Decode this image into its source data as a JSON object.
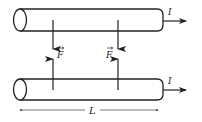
{
  "diagram": {
    "colors": {
      "stroke": "#222222",
      "dim_line": "#555555",
      "background": "#ffffff"
    },
    "wires": [
      {
        "id": "top",
        "current_label": "I",
        "direction": "right"
      },
      {
        "id": "bottom",
        "current_label": "I",
        "direction": "right"
      }
    ],
    "forces": [
      {
        "label": "F",
        "vector": true,
        "position": "left"
      },
      {
        "label": "F",
        "vector": true,
        "position": "right"
      }
    ],
    "length_label": "L"
  }
}
